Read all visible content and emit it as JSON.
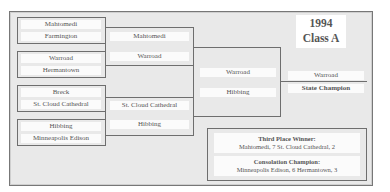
{
  "title": {
    "year": "1994",
    "class": "Class A"
  },
  "round1": [
    {
      "top": "Mahtomedi",
      "bottom": "Farmington"
    },
    {
      "top": "Warroad",
      "bottom": "Hermantown"
    },
    {
      "top": "Breck",
      "bottom": "St. Cloud Cathedral"
    },
    {
      "top": "Hibbing",
      "bottom": "Minneapolis Edison"
    }
  ],
  "semifinals": [
    {
      "top": "Mahtomedi",
      "bottom": "Warroad"
    },
    {
      "top": "St. Cloud Cathedral",
      "bottom": "Hibbing"
    }
  ],
  "final": {
    "top": "Warroad",
    "bottom": "Hibbing"
  },
  "champion": {
    "team": "Warroad",
    "label": "State Champion"
  },
  "results": {
    "third_place_label": "Third Place Winner:",
    "third_place_result": "Mahtomedi, 7  St. Cloud Cathedral, 2",
    "consolation_label": "Consolation Champion:",
    "consolation_result": "Minneapolis Edison, 6  Hermantown, 3"
  }
}
